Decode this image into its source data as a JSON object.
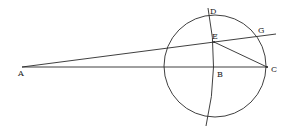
{
  "diagram": {
    "stroke_color": "#2a2a2a",
    "points": {
      "A": {
        "label": "A",
        "x": 24,
        "y": 67,
        "lx": 18,
        "ly": 76
      },
      "B": {
        "label": "B",
        "x": 214,
        "y": 67,
        "lx": 217,
        "ly": 77
      },
      "C": {
        "label": "C",
        "x": 267,
        "y": 67,
        "lx": 271,
        "ly": 72
      },
      "D": {
        "label": "D",
        "x": 209,
        "y": 9,
        "lx": 210,
        "ly": 14
      },
      "E": {
        "label": "E",
        "x": 214,
        "y": 42,
        "lx": 212,
        "ly": 39
      },
      "G": {
        "label": "G",
        "x": 258,
        "y": 34,
        "lx": 258,
        "ly": 33
      }
    },
    "circle": {
      "cx": 215,
      "cy": 66,
      "r": 51
    },
    "segments": [
      {
        "name": "line-AC",
        "from": "A",
        "to": "C"
      },
      {
        "name": "line-AEG",
        "from": "A",
        "to": "G-extended"
      },
      {
        "name": "line-EC",
        "from": "E",
        "to": "C"
      }
    ]
  }
}
